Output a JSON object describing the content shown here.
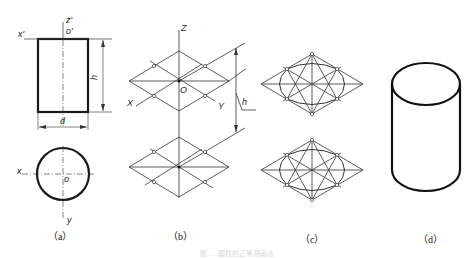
{
  "figure": {
    "panels": [
      {
        "id": "a",
        "caption": "（a）",
        "description": "Orthographic views of a cylinder: front view rectangle with height h and diameter d, top view circle",
        "labels": {
          "x_prime": "x'",
          "z_prime": "z'",
          "o_prime": "o'",
          "height": "h",
          "diameter": "d",
          "x": "x",
          "o": "o",
          "y": "y"
        }
      },
      {
        "id": "b",
        "caption": "（b）",
        "description": "Isometric axes with two rhombi (top and bottom faces) offset by height h",
        "labels": {
          "z": "Z",
          "x": "X",
          "y": "Y",
          "o": "O",
          "height": "h"
        }
      },
      {
        "id": "c",
        "caption": "（c）",
        "description": "Four-center approximate ellipse construction within rhombi"
      },
      {
        "id": "d",
        "caption": "（d）",
        "description": "Finished isometric drawing of the cylinder"
      }
    ],
    "figure_caption": "图 … 圆柱的正等测画法"
  },
  "colors": {
    "line": "#1a1a1a",
    "thin_line": "#333333",
    "background": "#ffffff"
  }
}
